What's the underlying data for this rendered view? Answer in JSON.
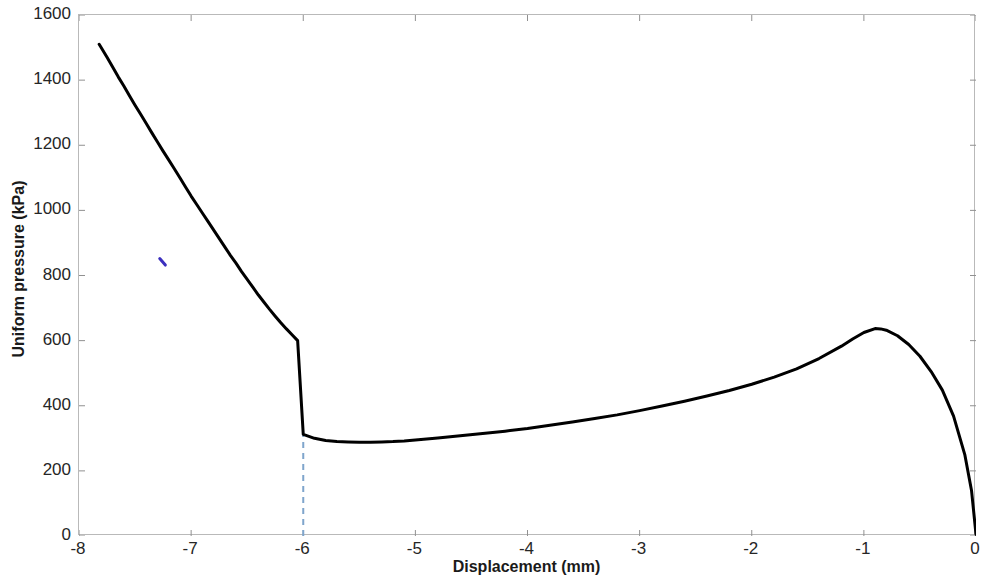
{
  "chart_data": {
    "type": "line",
    "title": "",
    "xlabel": "Displacement (mm)",
    "ylabel": "Uniform pressure (kPa)",
    "xlim": [
      -8,
      0
    ],
    "ylim": [
      0,
      1600
    ],
    "xticks": [
      "-8",
      "-7",
      "-6",
      "-5",
      "-4",
      "-3",
      "-2",
      "-1",
      "0"
    ],
    "xtick_values": [
      -8,
      -7,
      -6,
      -5,
      -4,
      -3,
      -2,
      -1,
      0
    ],
    "yticks": [
      "0",
      "200",
      "400",
      "600",
      "800",
      "1000",
      "1200",
      "1400",
      "1600"
    ],
    "ytick_values": [
      0,
      200,
      400,
      600,
      800,
      1000,
      1200,
      1400,
      1600
    ],
    "grid": false,
    "legend": "none",
    "series": [
      {
        "name": "Uniform pressure response",
        "color": "#000000",
        "linewidth": 3,
        "x": [
          -7.82,
          -7.75,
          -7.7,
          -7.65,
          -7.6,
          -7.55,
          -7.5,
          -7.45,
          -7.4,
          -7.35,
          -7.3,
          -7.25,
          -7.2,
          -7.15,
          -7.1,
          -7.05,
          -7.0,
          -6.95,
          -6.9,
          -6.85,
          -6.8,
          -6.75,
          -6.7,
          -6.65,
          -6.6,
          -6.55,
          -6.5,
          -6.45,
          -6.4,
          -6.35,
          -6.3,
          -6.25,
          -6.2,
          -6.15,
          -6.1,
          -6.05,
          -6.0,
          -5.9,
          -5.8,
          -5.7,
          -5.6,
          -5.5,
          -5.4,
          -5.3,
          -5.2,
          -5.1,
          -5.0,
          -4.8,
          -4.6,
          -4.4,
          -4.2,
          -4.0,
          -3.8,
          -3.6,
          -3.4,
          -3.2,
          -3.0,
          -2.8,
          -2.6,
          -2.4,
          -2.2,
          -2.0,
          -1.8,
          -1.6,
          -1.4,
          -1.2,
          -1.1,
          -1.0,
          -0.9,
          -0.85,
          -0.8,
          -0.7,
          -0.6,
          -0.5,
          -0.4,
          -0.3,
          -0.2,
          -0.1,
          -0.04,
          0.0
        ],
        "y": [
          1510,
          1470,
          1440,
          1410,
          1382,
          1352,
          1323,
          1295,
          1267,
          1238,
          1210,
          1182,
          1155,
          1128,
          1100,
          1072,
          1044,
          1018,
          992,
          966,
          940,
          914,
          888,
          862,
          838,
          812,
          788,
          764,
          740,
          718,
          696,
          675,
          655,
          636,
          618,
          600,
          312,
          300,
          293,
          290,
          289,
          288,
          288,
          289,
          290,
          292,
          295,
          301,
          308,
          315,
          322,
          330,
          340,
          350,
          361,
          372,
          385,
          399,
          414,
          430,
          447,
          466,
          488,
          513,
          545,
          583,
          605,
          625,
          637,
          636,
          632,
          615,
          588,
          552,
          505,
          448,
          368,
          250,
          140,
          5
        ]
      },
      {
        "name": "curve-marker-artifact",
        "color": "#3b2fbe",
        "x": [
          -7.28,
          -7.23
        ],
        "y": [
          852,
          832
        ]
      }
    ],
    "annotations": [
      {
        "name": "reference-line",
        "type": "vertical-dashed-line",
        "x": -6.0,
        "y_from": 0,
        "y_to": 311,
        "color": "#7fa5cc",
        "dash": "6,5",
        "linewidth": 2
      }
    ]
  },
  "axes": {
    "box_color": "#b9b9b9",
    "tick_color": "#909090",
    "text_color": "#262626"
  }
}
